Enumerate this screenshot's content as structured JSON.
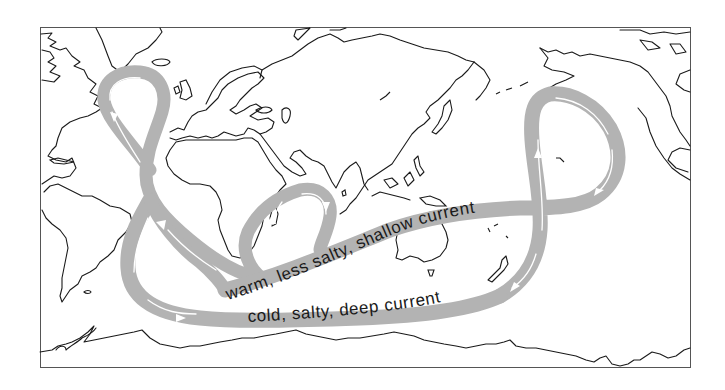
{
  "diagram": {
    "labels": {
      "warm_current": "warm, less salty, shallow current",
      "cold_current": "cold, salty, deep current"
    },
    "colors": {
      "band": "#b3b3b3",
      "band_stripe": "#ffffff",
      "coastline": "#1a1a1a",
      "frame": "#555555",
      "background": "#ffffff"
    },
    "icons": {
      "flow_arrow": "white arrowhead indicating current direction"
    }
  }
}
